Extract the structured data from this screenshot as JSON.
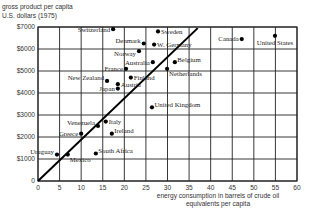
{
  "chart_data": {
    "type": "scatter",
    "title": "",
    "ylabel_lines": [
      "gross product per capita",
      "U.S. dollars (1975)"
    ],
    "xlabel_lines": [
      "energy consumption in barrels of crude oil",
      "equivalents per capita"
    ],
    "xlim": [
      0,
      60
    ],
    "ylim": [
      0,
      7000
    ],
    "x_ticks": [
      0,
      5,
      10,
      15,
      20,
      25,
      30,
      35,
      40,
      45,
      50,
      55,
      60
    ],
    "x_tick_labels": [
      "0",
      "5",
      "10",
      "15",
      "20",
      "25",
      "30",
      "35",
      "40",
      "45",
      "50",
      "55",
      "60"
    ],
    "y_ticks": [
      0,
      1000,
      2000,
      3000,
      4000,
      5000,
      6000,
      7000
    ],
    "y_tick_labels": [
      "0",
      "$1000",
      "$2000",
      "$3000",
      "$4000",
      "$5000",
      "$6000",
      "$7000"
    ],
    "grid": true,
    "trend_line": {
      "x": [
        0,
        37
      ],
      "y": [
        0,
        6950
      ]
    },
    "points": [
      {
        "label": "Switzerland",
        "x": 17.4,
        "y": 6900,
        "label_pos": "left"
      },
      {
        "label": "Sweden",
        "x": 27.8,
        "y": 6800,
        "label_pos": "right"
      },
      {
        "label": "Denmark",
        "x": 24.5,
        "y": 6250,
        "label_pos": "left-up"
      },
      {
        "label": "W. Germany",
        "x": 26.9,
        "y": 6200,
        "label_pos": "right"
      },
      {
        "label": "Norway",
        "x": 23.4,
        "y": 5900,
        "label_pos": "left-down"
      },
      {
        "label": "Australia",
        "x": 26.6,
        "y": 5400,
        "label_pos": "left"
      },
      {
        "label": "Belgium",
        "x": 31.7,
        "y": 5400,
        "label_pos": "right-up"
      },
      {
        "label": "France",
        "x": 20.4,
        "y": 5100,
        "label_pos": "left"
      },
      {
        "label": "Netherlands",
        "x": 29.9,
        "y": 5100,
        "label_pos": "right-down"
      },
      {
        "label": "Finland",
        "x": 21.5,
        "y": 4700,
        "label_pos": "right"
      },
      {
        "label": "New Zealand",
        "x": 16.0,
        "y": 4550,
        "label_pos": "left-up"
      },
      {
        "label": "Austria",
        "x": 18.5,
        "y": 4400,
        "label_pos": "right"
      },
      {
        "label": "Japan",
        "x": 18.5,
        "y": 4200,
        "label_pos": "left"
      },
      {
        "label": "Canada",
        "x": 47.2,
        "y": 6450,
        "label_pos": "left"
      },
      {
        "label": "United States",
        "x": 54.9,
        "y": 6600,
        "label_pos": "below"
      },
      {
        "label": "United Kingdom",
        "x": 26.4,
        "y": 3350,
        "label_pos": "right-up"
      },
      {
        "label": "Venezuela",
        "x": 13.9,
        "y": 2500,
        "label_pos": "left-up"
      },
      {
        "label": "Italy",
        "x": 15.7,
        "y": 2700,
        "label_pos": "right"
      },
      {
        "label": "Ireland",
        "x": 17.1,
        "y": 2150,
        "label_pos": "right-up"
      },
      {
        "label": "Greece",
        "x": 10.0,
        "y": 2150,
        "label_pos": "left"
      },
      {
        "label": "Uruguay",
        "x": 4.4,
        "y": 1200,
        "label_pos": "left-up"
      },
      {
        "label": "Mexico",
        "x": 6.9,
        "y": 1200,
        "label_pos": "right-down"
      },
      {
        "label": "South Africa",
        "x": 13.4,
        "y": 1250,
        "label_pos": "right-up"
      }
    ]
  }
}
